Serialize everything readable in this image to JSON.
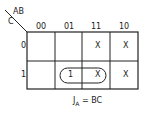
{
  "kmap": {
    "row_var": "C",
    "col_var": "AB",
    "columns": [
      "00",
      "01",
      "11",
      "10"
    ],
    "rows": [
      "0",
      "1"
    ],
    "cells": [
      [
        "",
        "",
        "X",
        "X"
      ],
      [
        "",
        "1",
        "X",
        "X"
      ]
    ],
    "equation_lhs": "J",
    "equation_sub": "A",
    "equation_rhs": "= BC"
  }
}
